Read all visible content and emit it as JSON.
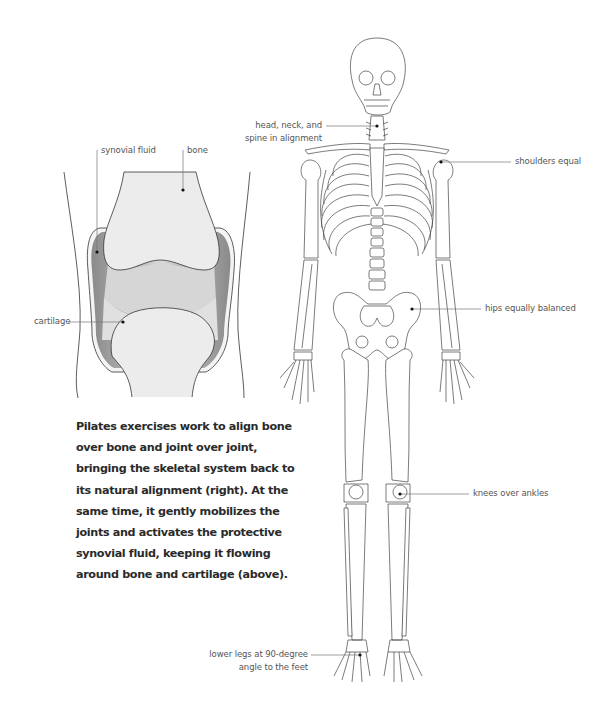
{
  "knee_diagram": {
    "labels": {
      "synovial_fluid": "synovial fluid",
      "bone": "bone",
      "cartilage": "cartilage"
    },
    "colors": {
      "bone": "#ececec",
      "cartilage": "#d9d9d9",
      "synovial_fluid": "#8c8c8c",
      "outline": "#333333"
    }
  },
  "caption": {
    "lines": [
      "Pilates exercises work to align bone",
      "over bone and joint over joint,",
      "bringing the skeletal system back to",
      "its natural alignment (right). At the",
      "same time, it gently mobilizes the",
      "joints and activates the protective",
      "synovial fluid, keeping it flowing",
      "around bone and cartilage (above)."
    ]
  },
  "skeleton_diagram": {
    "labels": {
      "head_neck_line1": "head, neck, and",
      "head_neck_line2": "spine in alignment",
      "shoulders": "shoulders equal",
      "hips": "hips equally balanced",
      "knees": "knees over ankles",
      "lower_legs_line1": "lower legs at 90-degree",
      "lower_legs_line2": "angle to the feet"
    }
  }
}
